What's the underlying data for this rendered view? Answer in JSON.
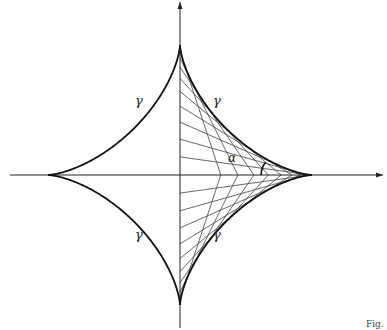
{
  "diagram": {
    "colors": {
      "background": "#ffffff",
      "curve": "#111111",
      "axis": "#222222",
      "segments": "#444444"
    },
    "origin": {
      "x": 180,
      "y": 175
    },
    "radius_x": 132,
    "radius_y": 130,
    "axes": {
      "x_axis": {
        "from": 10,
        "to": 383
      },
      "y_axis": {
        "from": 2,
        "to": 328
      }
    },
    "curve_label": "γ",
    "angle_label": "α",
    "labels": [
      {
        "id": "gamma-upper-left",
        "text": "γ",
        "x": 135,
        "y": 94
      },
      {
        "id": "gamma-upper-right",
        "text": "γ",
        "x": 213,
        "y": 94
      },
      {
        "id": "gamma-lower-left",
        "text": "γ",
        "x": 135,
        "y": 228
      },
      {
        "id": "gamma-lower-right",
        "text": "γ",
        "x": 213,
        "y": 228
      },
      {
        "id": "alpha",
        "text": "α",
        "x": 228,
        "y": 152
      }
    ],
    "segment_angles_deg": [
      8,
      16,
      24,
      32,
      40,
      48,
      56,
      64,
      72
    ],
    "alpha_arc": {
      "segment_index": 4,
      "radius": 20
    },
    "fig_caption": "Fig."
  }
}
